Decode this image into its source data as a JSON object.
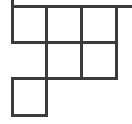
{
  "diagram": {
    "type": "young-diagram",
    "line_color": "#3b3b3b",
    "background": "#ffffff",
    "cells": [
      {
        "row": 1,
        "col": 1
      },
      {
        "row": 1,
        "col": 2
      },
      {
        "row": 1,
        "col": 3
      },
      {
        "row": 2,
        "col": 2
      },
      {
        "row": 2,
        "col": 3
      },
      {
        "row": 3,
        "col": 1
      }
    ],
    "axes": {
      "top_axis_extends_right": true,
      "left_axis_extends_up": true
    }
  }
}
